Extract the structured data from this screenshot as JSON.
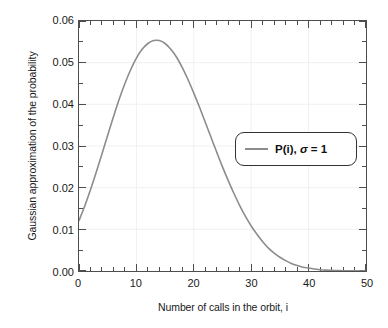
{
  "chart_data": {
    "type": "line",
    "title": "",
    "xlabel": "Number of calls in the orbit, i",
    "ylabel": "Gaussian approximation of the probability",
    "xlim": [
      0,
      50
    ],
    "ylim": [
      0,
      0.06
    ],
    "xticks": [
      "0",
      "10",
      "20",
      "30",
      "40",
      "50"
    ],
    "xtick_values": [
      0,
      10,
      20,
      30,
      40,
      50
    ],
    "yticks": [
      "0.00",
      "0.01",
      "0.02",
      "0.03",
      "0.04",
      "0.05",
      "0.06"
    ],
    "ytick_values": [
      0,
      0.01,
      0.02,
      0.03,
      0.04,
      0.05,
      0.06
    ],
    "x_minor_per_major": 5,
    "y_minor_per_major": 2,
    "grid": "faint",
    "legend_position": "center-right",
    "line_color": "#8c8c8c",
    "frame_color": "#4d4d4d",
    "background": "#ffffff",
    "series": [
      {
        "name": "P(i), σ = 1",
        "label_main": "P(i),",
        "label_symbol": "σ",
        "label_value": "= 1",
        "color": "#8c8c8c",
        "x": [
          0,
          1,
          2,
          3,
          4,
          5,
          6,
          7,
          8,
          9,
          10,
          11,
          12,
          13,
          14,
          15,
          16,
          17,
          18,
          19,
          20,
          21,
          22,
          23,
          24,
          25,
          26,
          27,
          28,
          29,
          30,
          31,
          32,
          33,
          34,
          35,
          36,
          37,
          38,
          39,
          40,
          41,
          42,
          43,
          44,
          45,
          46,
          47,
          48,
          49,
          50
        ],
        "y": [
          0.0121,
          0.0156,
          0.0195,
          0.0237,
          0.0281,
          0.0326,
          0.037,
          0.0412,
          0.045,
          0.0483,
          0.0511,
          0.0532,
          0.0546,
          0.0553,
          0.0553,
          0.0546,
          0.0532,
          0.0513,
          0.0488,
          0.0459,
          0.0427,
          0.0393,
          0.0357,
          0.0321,
          0.0285,
          0.025,
          0.0217,
          0.0186,
          0.0157,
          0.0131,
          0.0108,
          0.0088,
          0.007,
          0.0055,
          0.0043,
          0.0033,
          0.0025,
          0.0018,
          0.0013,
          0.0009,
          0.0007,
          0.0005,
          0.0003,
          0.0002,
          0.00015,
          0.0001,
          7e-05,
          4e-05,
          3e-05,
          2e-05,
          1e-05
        ]
      }
    ],
    "peak": {
      "x": 13.5,
      "y": 0.0553
    },
    "start_value": {
      "x": 0,
      "y": 0.0121
    }
  }
}
